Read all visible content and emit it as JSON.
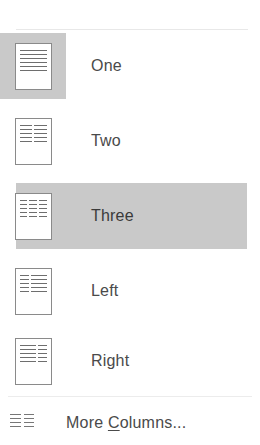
{
  "menu": {
    "name": "columns-dropdown",
    "items": [
      {
        "id": "one",
        "label": "One",
        "icon": "one-column-page-icon",
        "columns": 1,
        "selected": true,
        "hovered": false
      },
      {
        "id": "two",
        "label": "Two",
        "icon": "two-column-page-icon",
        "columns": 2,
        "selected": false,
        "hovered": false
      },
      {
        "id": "three",
        "label": "Three",
        "icon": "three-column-page-icon",
        "columns": 3,
        "selected": false,
        "hovered": true
      },
      {
        "id": "left",
        "label": "Left",
        "icon": "left-column-page-icon",
        "columns": 2,
        "selected": false,
        "hovered": false
      },
      {
        "id": "right",
        "label": "Right",
        "icon": "right-column-page-icon",
        "columns": 2,
        "selected": false,
        "hovered": false
      }
    ],
    "more": {
      "id": "more-columns",
      "label_before": "More ",
      "accelerator": "C",
      "label_after": "olumns...",
      "icon": "columns-grid-icon"
    },
    "colors": {
      "highlight": "#c9c9c9",
      "text": "#4a4a4a",
      "separator": "#e8e8e8",
      "icon_border": "#8a8a8a",
      "icon_line": "#6e6e6e",
      "background": "#ffffff"
    }
  }
}
